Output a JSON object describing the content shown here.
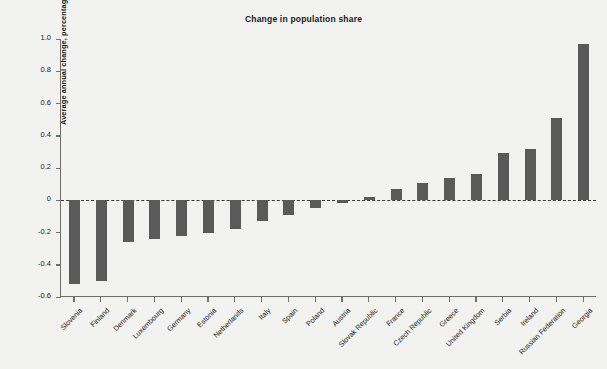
{
  "chart_data": {
    "type": "bar",
    "title": "Change in population share",
    "xlabel": "",
    "ylabel": "Average annual change, percentage points",
    "ylim": [
      -0.6,
      1.0
    ],
    "ytick_labels": [
      "1.0",
      "0.8",
      "0.6",
      "0.4",
      "0.2",
      "0",
      "-0.2",
      "-0.4",
      "-0.6"
    ],
    "ytick_values": [
      1.0,
      0.8,
      0.6,
      0.4,
      0.2,
      0,
      -0.2,
      -0.4,
      -0.6
    ],
    "grid": false,
    "legend": "none",
    "zero_reference_line": true,
    "bar_color": "#5a5a5a",
    "background_color": "#f2f2f0",
    "axis_color": "#6e6e6e",
    "categories": [
      "Slovenia",
      "Finland",
      "Denmark",
      "Luxembourg",
      "Germany",
      "Estonia",
      "Netherlands",
      "Italy",
      "Spain",
      "Poland",
      "Austria",
      "Slovak Republic",
      "France",
      "Czech Republic",
      "Greece",
      "United Kingdom",
      "Serbia",
      "Ireland",
      "Russian Federation",
      "Georgia"
    ],
    "values": [
      -0.52,
      -0.5,
      -0.26,
      -0.24,
      -0.22,
      -0.2,
      -0.18,
      -0.13,
      -0.09,
      -0.05,
      -0.02,
      0.02,
      0.07,
      0.11,
      0.14,
      0.16,
      0.29,
      0.32,
      0.51,
      0.97
    ]
  }
}
